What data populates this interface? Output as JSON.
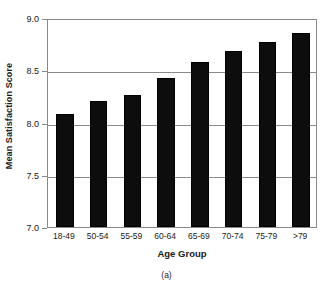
{
  "chart_data": {
    "type": "bar",
    "title": "",
    "xlabel": "Age Group",
    "ylabel": "Mean Satisfaction Score",
    "caption": "(a)",
    "categories": [
      "18-49",
      "50-54",
      "55-59",
      "60-64",
      "65-69",
      "70-74",
      "75-79",
      ">79"
    ],
    "values": [
      8.08,
      8.21,
      8.26,
      8.43,
      8.58,
      8.68,
      8.77,
      8.86
    ],
    "ylim": [
      7.0,
      9.0
    ],
    "yticks": [
      "7.0",
      "7.5",
      "8.0",
      "8.5",
      "9.0"
    ],
    "ytick_values": [
      7.0,
      7.5,
      8.0,
      8.5,
      9.0
    ],
    "grid": true,
    "grid_axis": "y",
    "legend": "none",
    "bar_color": "#0d0d0d",
    "axis_color": "#8a8a8a",
    "background_color": "#ffffff"
  }
}
